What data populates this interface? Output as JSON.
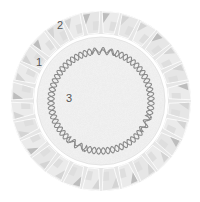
{
  "diagram": {
    "type": "virus-capsid-cross-section",
    "center": [
      101,
      101
    ],
    "outer_radius": 90,
    "inner_radius": 67,
    "core_radius": 64,
    "dna_radius": 50,
    "capsomere_count": 28,
    "colors": {
      "capsomere_light": "#e6e6e6",
      "capsomere_mid": "#d4d4d4",
      "capsomere_dark": "#bdbdbd",
      "core": "#f1f1f1",
      "core_speckle": "#dcdcdc",
      "dna": "#8a8a8a",
      "label": "#555555"
    }
  },
  "labels": [
    {
      "id": "1",
      "text": "1",
      "x": 36,
      "y": 57,
      "meaning": "capsid"
    },
    {
      "id": "2",
      "text": "2",
      "x": 57,
      "y": 20,
      "meaning": "capsomere"
    },
    {
      "id": "3",
      "text": "3",
      "x": 66,
      "y": 93,
      "meaning": "nucleic acid"
    }
  ]
}
